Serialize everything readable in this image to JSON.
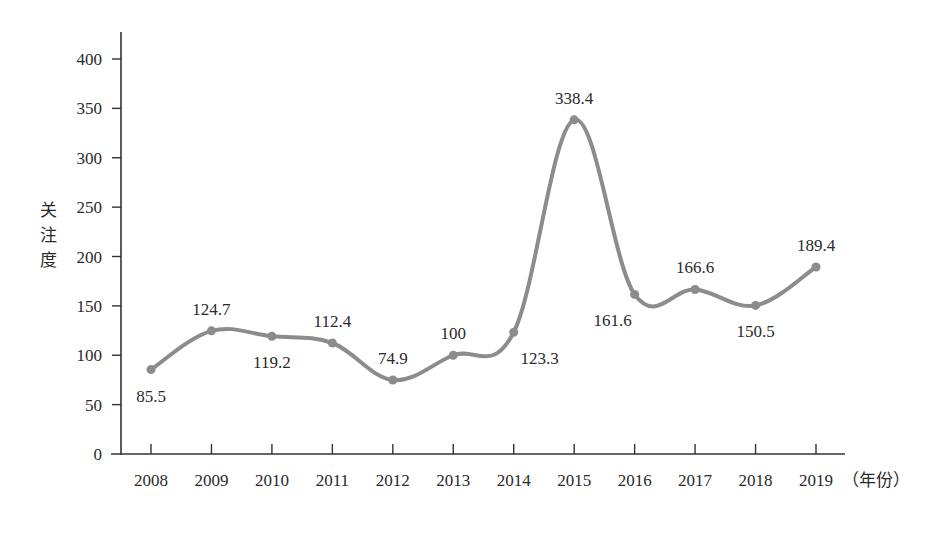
{
  "chart_data": {
    "type": "line",
    "title": "",
    "xlabel": "（年份）",
    "ylabel": "关注度",
    "ylim": [
      0,
      400
    ],
    "yticks": [
      0,
      50,
      100,
      150,
      200,
      250,
      300,
      350,
      400
    ],
    "grid": false,
    "legend": null,
    "smooth": true,
    "line_color": "#8c8c8c",
    "categories": [
      "2008",
      "2009",
      "2010",
      "2011",
      "2012",
      "2013",
      "2014",
      "2015",
      "2016",
      "2017",
      "2018",
      "2019"
    ],
    "values": [
      85.5,
      124.7,
      119.2,
      112.4,
      74.9,
      100,
      123.3,
      338.4,
      161.6,
      166.6,
      150.5,
      189.4
    ],
    "data_labels": [
      "85.5",
      "124.7",
      "119.2",
      "112.4",
      "74.9",
      "100",
      "123.3",
      "338.4",
      "161.6",
      "166.6",
      "150.5",
      "189.4"
    ]
  }
}
